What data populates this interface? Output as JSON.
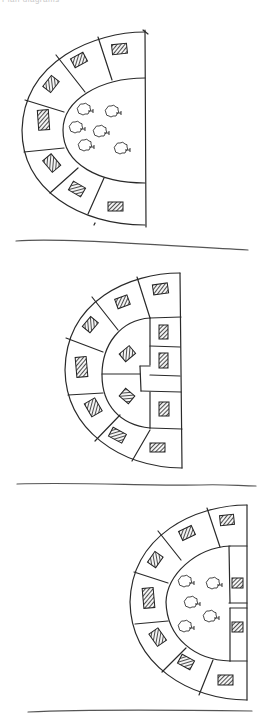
{
  "caption": "Plan diagrams",
  "figure": {
    "type": "hand-drawn architectural plan sketches",
    "panels": [
      {
        "id": "plan-1",
        "description": "Semicircular building with outer ring of 8 rooms around open courtyard with trees",
        "rooms": 8,
        "trees": 7
      },
      {
        "id": "plan-2",
        "description": "Semicircular building with outer ring of 7 rooms, inner ring of 2 rooms and 4 rooms along straight wall",
        "rooms": 13,
        "trees": 0
      },
      {
        "id": "plan-3",
        "description": "Semicircular building with outer ring of 7 rooms, 2 rooms along straight wall, and courtyard with trees",
        "rooms": 9,
        "trees": 5
      }
    ],
    "separators": 3,
    "colors": {
      "ink": "#2a2a2a",
      "background": "#ffffff"
    }
  }
}
